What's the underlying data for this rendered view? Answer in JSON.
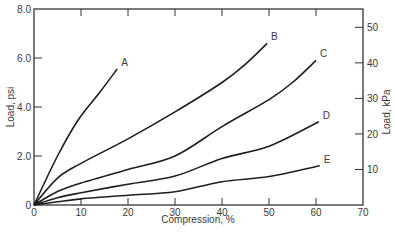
{
  "chart_data": {
    "type": "line",
    "title": "",
    "xlabel": "Compression, %",
    "ylabel": "Load, psi",
    "ylabel_right": "Load, kPa",
    "xlim": [
      0,
      70
    ],
    "ylim": [
      0,
      8.0
    ],
    "ylim_right_kpa": [
      0,
      55.2
    ],
    "x_ticks": [
      0,
      10,
      20,
      30,
      40,
      50,
      60,
      70
    ],
    "x_tick_labels": [
      "0",
      "10",
      "20",
      "30",
      "40",
      "50",
      "60",
      "70"
    ],
    "y_ticks": [
      0,
      2.0,
      4.0,
      6.0,
      8.0
    ],
    "y_tick_labels": [
      "0",
      "2.0",
      "4.0",
      "6.0",
      "8.0"
    ],
    "y_right_ticks": [
      10,
      20,
      30,
      40,
      50
    ],
    "y_right_tick_labels": [
      "10",
      "20",
      "30",
      "40",
      "50"
    ],
    "grid": false,
    "legend": "none (curves labeled inline at endpoints)",
    "series": [
      {
        "name": "A",
        "x": [
          0,
          5,
          9.4,
          14,
          17.7
        ],
        "y": [
          0,
          2.0,
          3.47,
          4.6,
          5.55
        ]
      },
      {
        "name": "B",
        "x": [
          0,
          5,
          10,
          20,
          30,
          40,
          45,
          49.6
        ],
        "y": [
          0,
          1.1,
          1.7,
          2.7,
          3.8,
          5.0,
          5.75,
          6.6
        ]
      },
      {
        "name": "C",
        "x": [
          0,
          5,
          10,
          20,
          30,
          40,
          50,
          55,
          60
        ],
        "y": [
          0,
          0.55,
          0.9,
          1.45,
          2.0,
          3.2,
          4.3,
          5.0,
          5.9
        ]
      },
      {
        "name": "D",
        "x": [
          0,
          5,
          10,
          20,
          30,
          40,
          50,
          60.6
        ],
        "y": [
          0,
          0.3,
          0.5,
          0.85,
          1.18,
          1.9,
          2.4,
          3.4
        ]
      },
      {
        "name": "E",
        "x": [
          0,
          5,
          10,
          20,
          30,
          40,
          50,
          60.8
        ],
        "y": [
          0,
          0.13,
          0.25,
          0.4,
          0.54,
          0.95,
          1.16,
          1.6
        ]
      }
    ]
  }
}
